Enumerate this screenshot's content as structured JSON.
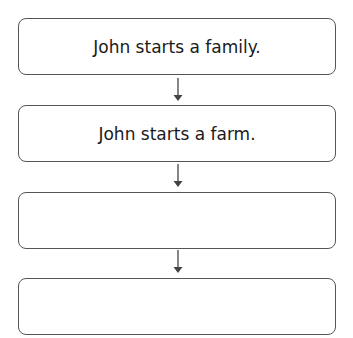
{
  "flowchart": {
    "steps": [
      {
        "text": "John starts a family."
      },
      {
        "text": "John starts a farm."
      },
      {
        "text": ""
      },
      {
        "text": ""
      }
    ],
    "colors": {
      "border": "#555555",
      "arrow": "#444444",
      "text": "#1a1a1a"
    }
  }
}
